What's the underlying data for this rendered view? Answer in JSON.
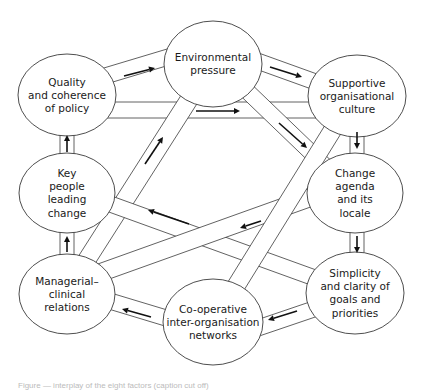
{
  "diagram": {
    "type": "network-of-factors",
    "nodes": [
      {
        "id": "environmental",
        "lines": [
          "Environmental",
          "pressure"
        ],
        "cx": 213,
        "cy": 64,
        "rx": 49,
        "ry": 43
      },
      {
        "id": "quality",
        "lines": [
          "Quality",
          "and coherence",
          "of policy"
        ],
        "cx": 67,
        "cy": 95,
        "rx": 49,
        "ry": 41
      },
      {
        "id": "supportive",
        "lines": [
          "Supportive",
          "organisational",
          "culture"
        ],
        "cx": 357,
        "cy": 96,
        "rx": 49,
        "ry": 41
      },
      {
        "id": "keypeople",
        "lines": [
          "Key",
          "people",
          "leading",
          "change"
        ],
        "cx": 67,
        "cy": 193,
        "rx": 48,
        "ry": 40
      },
      {
        "id": "changeagenda",
        "lines": [
          "Change",
          "agenda",
          "and its",
          "locale"
        ],
        "cx": 355,
        "cy": 193,
        "rx": 48,
        "ry": 40
      },
      {
        "id": "managerial",
        "lines": [
          "Managerial–",
          "clinical",
          "relations"
        ],
        "cx": 67,
        "cy": 294,
        "rx": 48,
        "ry": 40
      },
      {
        "id": "simplicity",
        "lines": [
          "Simplicity",
          "and clarity of",
          "goals and",
          "priorities"
        ],
        "cx": 355,
        "cy": 293,
        "rx": 49,
        "ry": 41
      },
      {
        "id": "cooperative",
        "lines": [
          "Co-operative",
          "inter-organisation",
          "networks"
        ],
        "cx": 213,
        "cy": 322,
        "rx": 50,
        "ry": 43
      }
    ],
    "edges": [
      {
        "from": "quality",
        "to": "environmental",
        "x1": 115,
        "y1": 73,
        "x2": 165,
        "y2": 58,
        "half": 8,
        "arrow": {
          "x1": 124,
          "y1": 76,
          "x2": 155,
          "y2": 68
        }
      },
      {
        "from": "environmental",
        "to": "supportive",
        "x1": 260,
        "y1": 62,
        "x2": 310,
        "y2": 80,
        "half": 8,
        "arrow": {
          "x1": 270,
          "y1": 67,
          "x2": 302,
          "y2": 77
        }
      },
      {
        "from": "quality",
        "to": "supportive",
        "x1": 112,
        "y1": 110,
        "x2": 312,
        "y2": 110,
        "half": 8,
        "arrow": {
          "x1": 196,
          "y1": 111,
          "x2": 240,
          "y2": 111
        }
      },
      {
        "from": "environmental",
        "to": "changeagenda",
        "x1": 246,
        "y1": 90,
        "x2": 322,
        "y2": 163,
        "half": 8,
        "arrow": {
          "x1": 279,
          "y1": 123,
          "x2": 307,
          "y2": 148
        }
      },
      {
        "from": "supportive",
        "to": "changeagenda",
        "x1": 357,
        "y1": 137,
        "x2": 357,
        "y2": 153,
        "half": 7,
        "arrow": {
          "x1": 357,
          "y1": 132,
          "x2": 357,
          "y2": 149
        }
      },
      {
        "from": "changeagenda",
        "to": "simplicity",
        "x1": 357,
        "y1": 233,
        "x2": 357,
        "y2": 252,
        "half": 7,
        "arrow": {
          "x1": 357,
          "y1": 236,
          "x2": 357,
          "y2": 253
        }
      },
      {
        "from": "simplicity",
        "to": "cooperative",
        "x1": 311,
        "y1": 310,
        "x2": 258,
        "y2": 328,
        "half": 8,
        "arrow": {
          "x1": 297,
          "y1": 311,
          "x2": 268,
          "y2": 320
        }
      },
      {
        "from": "cooperative",
        "to": "managerial",
        "x1": 166,
        "y1": 318,
        "x2": 113,
        "y2": 302,
        "half": 8,
        "arrow": {
          "x1": 151,
          "y1": 317,
          "x2": 122,
          "y2": 309
        }
      },
      {
        "from": "managerial",
        "to": "keypeople",
        "x1": 67,
        "y1": 254,
        "x2": 67,
        "y2": 233,
        "half": 7,
        "arrow": {
          "x1": 67,
          "y1": 252,
          "x2": 67,
          "y2": 236
        }
      },
      {
        "from": "keypeople",
        "to": "quality",
        "x1": 67,
        "y1": 153,
        "x2": 67,
        "y2": 136,
        "half": 7,
        "arrow": {
          "x1": 67,
          "y1": 152,
          "x2": 67,
          "y2": 135
        }
      },
      {
        "from": "managerial",
        "to": "environmental",
        "x1": 88,
        "y1": 258,
        "x2": 190,
        "y2": 98,
        "half": 9,
        "arrow": {
          "x1": 145,
          "y1": 164,
          "x2": 163,
          "y2": 137
        }
      },
      {
        "from": "changeagenda",
        "to": "keypeople",
        "x1": 310,
        "y1": 215,
        "x2": 112,
        "y2": 212,
        "half": 0,
        "arrow": null,
        "skip": true
      },
      {
        "from": "simplicity",
        "to": "keypeople",
        "x1": 312,
        "y1": 277,
        "x2": 113,
        "y2": 205,
        "half": 8,
        "arrow": {
          "x1": 189,
          "y1": 224,
          "x2": 148,
          "y2": 210
        }
      },
      {
        "from": "changeagenda",
        "to": "managerial",
        "x1": 309,
        "y1": 198,
        "x2": 105,
        "y2": 271,
        "half": 9,
        "arrow": {
          "x1": 261,
          "y1": 221,
          "x2": 240,
          "y2": 228
        }
      },
      {
        "from": "supportive",
        "to": "cooperative",
        "x1": 332,
        "y1": 131,
        "x2": 236,
        "y2": 286,
        "half": 9,
        "arrow": null
      }
    ],
    "caption": "Figure — interplay of the eight factors (caption cut off)"
  }
}
